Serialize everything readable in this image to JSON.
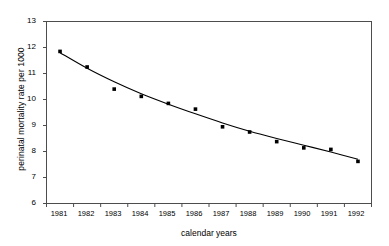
{
  "chart_data": {
    "type": "scatter",
    "title": "",
    "xlabel": "calendar years",
    "ylabel": "perinatal mortality rate per 1000",
    "x": [
      1981,
      1982,
      1983,
      1984,
      1985,
      1986,
      1987,
      1988,
      1989,
      1990,
      1991,
      1992
    ],
    "categories": [
      "1981",
      "1982",
      "1983",
      "1984",
      "1985",
      "1986",
      "1987",
      "1988",
      "1989",
      "1990",
      "1991",
      "1992"
    ],
    "values": [
      11.85,
      11.25,
      10.4,
      10.12,
      9.85,
      9.63,
      8.95,
      8.75,
      8.38,
      8.14,
      8.08,
      7.62
    ],
    "series": [
      {
        "name": "perinatal mortality rate",
        "marker": "filled-square",
        "values": [
          11.85,
          11.25,
          10.4,
          10.12,
          9.85,
          9.63,
          8.95,
          8.75,
          8.38,
          8.14,
          8.08,
          7.62
        ]
      },
      {
        "name": "fitted trend curve",
        "marker": "none",
        "values": [
          11.8,
          11.2,
          10.68,
          10.22,
          9.82,
          9.45,
          9.1,
          8.78,
          8.5,
          8.24,
          7.98,
          7.7
        ]
      }
    ],
    "ylim": [
      6,
      13
    ],
    "yticks": [
      6,
      7,
      8,
      9,
      10,
      11,
      12,
      13
    ],
    "ytick_labels": [
      "6",
      "7",
      "8",
      "9",
      "10",
      "11",
      "12",
      "13"
    ],
    "xlim": [
      1980.5,
      1992.5
    ],
    "xtick_labels": [
      "1981",
      "1982",
      "1983",
      "1984",
      "1985",
      "1986",
      "1987",
      "1988",
      "1989",
      "1990",
      "1991",
      "1992"
    ],
    "grid": false,
    "legend": "none",
    "marker_color": "#000000",
    "line_color": "#000000",
    "axis_color": "#4d4d4d",
    "background_color": "#ffffff"
  }
}
